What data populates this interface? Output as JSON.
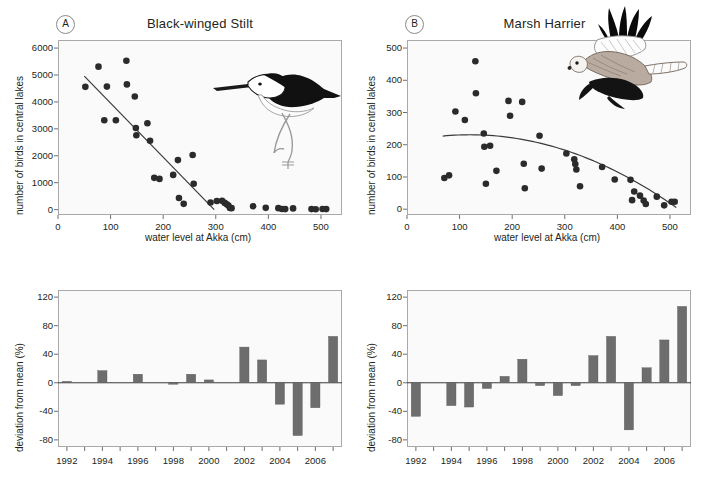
{
  "figure": {
    "panels": [
      "A",
      "B",
      "C",
      "D"
    ]
  },
  "panel_a": {
    "tag": "A",
    "title": "Black-winged Stilt",
    "bird_icon": "black-winged-stilt-illustration",
    "chart_data": {
      "type": "scatter",
      "title": "Black-winged Stilt",
      "xlabel": "water level at Akka (cm)",
      "ylabel": "number of birds in central lakes",
      "xlim": [
        0,
        540
      ],
      "ylim": [
        -200,
        6300
      ],
      "xticks": [
        0,
        100,
        200,
        300,
        400,
        500
      ],
      "yticks": [
        0,
        1000,
        2000,
        3000,
        4000,
        5000,
        6000
      ],
      "grid": false,
      "legend": "none",
      "points": [
        [
          52,
          4560
        ],
        [
          77,
          5310
        ],
        [
          88,
          3320
        ],
        [
          93,
          4570
        ],
        [
          110,
          3320
        ],
        [
          130,
          5530
        ],
        [
          131,
          4650
        ],
        [
          146,
          4200
        ],
        [
          148,
          3030
        ],
        [
          149,
          2760
        ],
        [
          170,
          3210
        ],
        [
          175,
          2560
        ],
        [
          183,
          1180
        ],
        [
          193,
          1140
        ],
        [
          219,
          1290
        ],
        [
          228,
          1840
        ],
        [
          230,
          430
        ],
        [
          239,
          215
        ],
        [
          256,
          2030
        ],
        [
          258,
          960
        ],
        [
          290,
          265
        ],
        [
          302,
          320
        ],
        [
          312,
          325
        ],
        [
          317,
          250
        ],
        [
          321,
          200
        ],
        [
          324,
          155
        ],
        [
          327,
          60
        ],
        [
          330,
          55
        ],
        [
          371,
          125
        ],
        [
          395,
          65
        ],
        [
          419,
          55
        ],
        [
          426,
          25
        ],
        [
          432,
          20
        ],
        [
          447,
          45
        ],
        [
          482,
          20
        ],
        [
          490,
          15
        ],
        [
          503,
          25
        ],
        [
          510,
          20
        ]
      ],
      "trendline": {
        "type": "linear",
        "x_start": 50,
        "y_start": 4960,
        "x_end": 297,
        "y_end": 0
      }
    }
  },
  "panel_b": {
    "tag": "B",
    "title": "Marsh Harrier",
    "bird_icon": "marsh-harrier-illustration",
    "chart_data": {
      "type": "scatter",
      "title": "Marsh Harrier",
      "xlabel": "water level at Akka (cm)",
      "ylabel": "number of birds in central lakes",
      "xlim": [
        0,
        540
      ],
      "ylim": [
        -18,
        525
      ],
      "xticks": [
        0,
        100,
        200,
        300,
        400,
        500
      ],
      "yticks": [
        0,
        100,
        200,
        300,
        400,
        500
      ],
      "grid": false,
      "legend": "none",
      "points": [
        [
          71,
          97
        ],
        [
          80,
          105
        ],
        [
          92,
          303
        ],
        [
          110,
          277
        ],
        [
          130,
          459
        ],
        [
          131,
          360
        ],
        [
          146,
          235
        ],
        [
          147,
          194
        ],
        [
          150,
          79
        ],
        [
          158,
          197
        ],
        [
          170,
          119
        ],
        [
          193,
          336
        ],
        [
          196,
          290
        ],
        [
          219,
          333
        ],
        [
          222,
          141
        ],
        [
          224,
          65
        ],
        [
          252,
          228
        ],
        [
          256,
          126
        ],
        [
          303,
          173
        ],
        [
          318,
          155
        ],
        [
          320,
          140
        ],
        [
          322,
          123
        ],
        [
          329,
          71
        ],
        [
          371,
          131
        ],
        [
          395,
          92
        ],
        [
          425,
          91
        ],
        [
          428,
          28
        ],
        [
          432,
          55
        ],
        [
          443,
          42
        ],
        [
          450,
          27
        ],
        [
          454,
          16
        ],
        [
          475,
          39
        ],
        [
          489,
          12
        ],
        [
          503,
          23
        ],
        [
          509,
          23
        ]
      ],
      "trendline": {
        "type": "quadratic",
        "x_start": 68,
        "x_end": 512,
        "x_peak": 120,
        "y_peak": 231,
        "y_start": 229,
        "y_end": 5
      }
    }
  },
  "panel_c": {
    "chart_data": {
      "type": "bar",
      "title": "",
      "xlabel": "",
      "ylabel": "deviation from mean (%)",
      "categories": [
        "1992",
        "1993",
        "1994",
        "1995",
        "1996",
        "1997",
        "1998",
        "1999",
        "2000",
        "2001",
        "2002",
        "2003",
        "2004",
        "2005",
        "2006",
        "2007"
      ],
      "values": [
        2,
        0,
        17,
        0,
        12,
        0,
        -2,
        12,
        4,
        0,
        50,
        32,
        -30,
        -74,
        -35,
        65
      ],
      "ylim": [
        -90,
        130
      ],
      "yticks": [
        -80,
        -40,
        0,
        40,
        80,
        120
      ],
      "xtick_labels_shown": [
        "1992",
        "1994",
        "1996",
        "1998",
        "2000",
        "2002",
        "2004",
        "2006"
      ],
      "grid": false,
      "bar_color": "#6d6d6d"
    }
  },
  "panel_d": {
    "chart_data": {
      "type": "bar",
      "title": "",
      "xlabel": "",
      "ylabel": "deviation from mean (%)",
      "categories": [
        "1992",
        "1993",
        "1994",
        "1995",
        "1996",
        "1997",
        "1998",
        "1999",
        "2000",
        "2001",
        "2002",
        "2003",
        "2004",
        "2005",
        "2006",
        "2007"
      ],
      "values": [
        -47,
        0,
        -32,
        -34,
        -8,
        9,
        33,
        -4,
        -18,
        -4,
        38,
        65,
        -66,
        21,
        60,
        107
      ],
      "ylim": [
        -90,
        130
      ],
      "yticks": [
        -80,
        -40,
        0,
        40,
        80,
        120
      ],
      "xtick_labels_shown": [
        "1992",
        "1994",
        "1996",
        "1998",
        "2000",
        "2002",
        "2004",
        "2006"
      ],
      "grid": false,
      "bar_color": "#6d6d6d"
    }
  }
}
